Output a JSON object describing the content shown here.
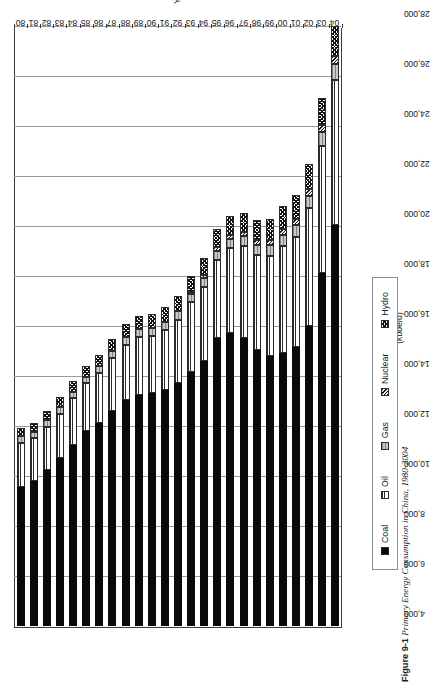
{
  "chart_data": {
    "type": "bar",
    "subtype": "stacked-horizontal",
    "title": "Primary Energy Consumption in China, 1980-2004",
    "xlabel": "Years",
    "ylabel": "(kboe/d)",
    "ylim": [
      4000,
      28000
    ],
    "ytick_step": 2000,
    "grid": true,
    "legend_position": "bottom",
    "orientation": "rotated-90-ccw",
    "categories": [
      "80",
      "81",
      "82",
      "83",
      "84",
      "85",
      "86",
      "87",
      "88",
      "89",
      "90",
      "91",
      "92",
      "93",
      "94",
      "95",
      "96",
      "97",
      "98",
      "99",
      "00",
      "01",
      "02",
      "03",
      "04"
    ],
    "ytick_labels": [
      "28,000",
      "26,000",
      "24,000",
      "22,000",
      "20,000",
      "18,000",
      "16,000",
      "14,000",
      "12,000",
      "10,000",
      "8,000",
      "6,000",
      "4,000"
    ],
    "series": [
      {
        "name": "Coal",
        "values": [
          5560,
          5800,
          6230,
          6700,
          7250,
          7800,
          8100,
          8600,
          9050,
          9250,
          9300,
          9450,
          9700,
          10150,
          10600,
          11500,
          11700,
          11500,
          11050,
          10800,
          10900,
          11150,
          12000,
          14100,
          16050
        ]
      },
      {
        "name": "Oil",
        "values": [
          1760,
          1700,
          1730,
          1780,
          1850,
          1900,
          2000,
          2100,
          2200,
          2300,
          2300,
          2400,
          2550,
          2800,
          2950,
          3150,
          3400,
          3700,
          3800,
          4000,
          4300,
          4400,
          4700,
          5100,
          5800
        ]
      },
      {
        "name": "Gas",
        "values": [
          260,
          260,
          260,
          260,
          270,
          270,
          280,
          290,
          300,
          310,
          310,
          320,
          330,
          340,
          350,
          360,
          370,
          390,
          400,
          420,
          450,
          480,
          500,
          540,
          620
        ]
      },
      {
        "name": "Nuclear",
        "values": [
          0,
          0,
          0,
          0,
          0,
          0,
          0,
          0,
          0,
          0,
          0,
          0,
          0,
          60,
          130,
          150,
          160,
          160,
          170,
          200,
          230,
          240,
          260,
          300,
          330
        ]
      },
      {
        "name": "Hydro",
        "values": [
          330,
          350,
          380,
          400,
          420,
          440,
          470,
          490,
          520,
          540,
          570,
          590,
          620,
          640,
          680,
          710,
          750,
          780,
          820,
          870,
          900,
          950,
          1000,
          1080,
          1180
        ]
      }
    ]
  },
  "axis": {
    "value_axis_label": "(kboe/d)",
    "category_axis_label": "Years"
  },
  "legend": {
    "items": [
      {
        "label": "Coal",
        "swatch": "coal-swatch"
      },
      {
        "label": "Oil",
        "swatch": "oil-swatch"
      },
      {
        "label": "Gas",
        "swatch": "gas-swatch"
      },
      {
        "label": "Nuclear",
        "swatch": "nuclear-swatch"
      },
      {
        "label": "Hydro",
        "swatch": "hydro-swatch"
      }
    ]
  },
  "caption": {
    "number": "Figure 9-1",
    "separator": "   ",
    "title": "Primary Energy Consumption in China, 1980-2004"
  }
}
